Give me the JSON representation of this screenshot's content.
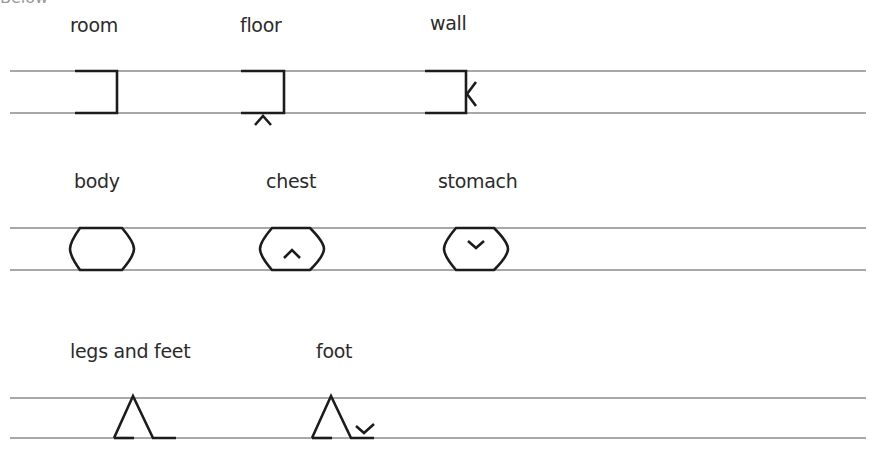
{
  "page": {
    "cutoff_text": "Below"
  },
  "rows": [
    {
      "items": [
        {
          "label": "room",
          "glyph": "room-glyph"
        },
        {
          "label": "floor",
          "glyph": "floor-glyph"
        },
        {
          "label": "wall",
          "glyph": "wall-glyph"
        }
      ]
    },
    {
      "items": [
        {
          "label": "body",
          "glyph": "body-glyph"
        },
        {
          "label": "chest",
          "glyph": "chest-glyph"
        },
        {
          "label": "stomach",
          "glyph": "stomach-glyph"
        }
      ]
    },
    {
      "items": [
        {
          "label": "legs and feet",
          "glyph": "legs-and-feet-glyph"
        },
        {
          "label": "foot",
          "glyph": "foot-glyph"
        }
      ]
    }
  ],
  "colors": {
    "guide_line": "#a8a8a8",
    "stroke": "#1c1c1c",
    "text": "#2b2b2b"
  }
}
